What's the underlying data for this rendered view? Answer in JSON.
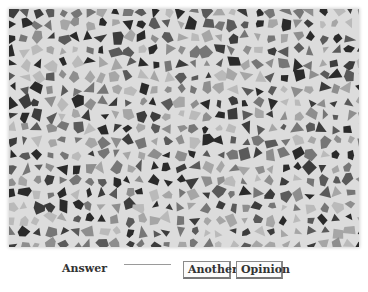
{
  "image": {
    "alt": "grayscale mosaic of irregular polygon tiles",
    "background_color": "#dcdcdc",
    "tile_colors": [
      "#2a2a2a",
      "#3c3c3c",
      "#5a5a5a",
      "#767676",
      "#8e8e8e",
      "#a6a6a6",
      "#bababa"
    ]
  },
  "form": {
    "answer_label": "Answer",
    "answer_value": ""
  },
  "buttons": {
    "another_label": "Another",
    "opinion_label": "Opinion"
  }
}
